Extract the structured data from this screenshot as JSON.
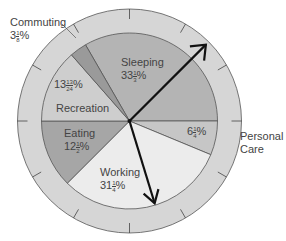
{
  "chart_data": {
    "type": "pie",
    "title": "",
    "style": "clock-face pie with outer hour ring and hands",
    "start_angle_deg": -30,
    "direction": "clockwise",
    "categories": [
      "Sleeping",
      "Personal Care",
      "Working",
      "Eating",
      "Recreation",
      "Commuting"
    ],
    "values": [
      33.333,
      6.25,
      31.25,
      12.5,
      13.5417,
      3.125
    ],
    "value_labels": [
      "33 1/3%",
      "6 1/4%",
      "31 1/4%",
      "12 1/2%",
      "13 13/24%",
      "3 1/8%"
    ],
    "colors": [
      "#b4b4b4",
      "#c6c6c6",
      "#ececec",
      "#a6a6a6",
      "#cecece",
      "#9a9a9a"
    ],
    "ring_color": "#d6d6d6",
    "tick_count": 12,
    "hands": [
      {
        "name": "minute-hand",
        "angle_deg": 45,
        "length": "outer"
      },
      {
        "name": "hour-hand",
        "angle_deg": 163,
        "length": "inner"
      }
    ]
  },
  "labels": {
    "sleeping": {
      "name": "Sleeping",
      "whole": "33",
      "num": "1",
      "den": "3"
    },
    "personal_care": {
      "name_line1": "Personal",
      "name_line2": "Care",
      "whole": "6",
      "num": "1",
      "den": "4"
    },
    "working": {
      "name": "Working",
      "whole": "31",
      "num": "1",
      "den": "4"
    },
    "eating": {
      "name": "Eating",
      "whole": "12",
      "num": "1",
      "den": "2"
    },
    "recreation": {
      "name": "Recreation",
      "whole": "13",
      "num": "13",
      "den": "24"
    },
    "commuting": {
      "name": "Commuting",
      "whole": "3",
      "num": "1",
      "den": "8"
    },
    "percent": "%"
  }
}
